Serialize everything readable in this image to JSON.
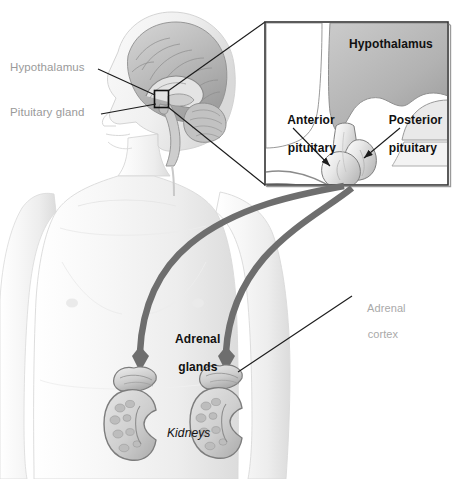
{
  "figure": {
    "background_color": "#ffffff"
  },
  "labels": {
    "hypothalamus_head": "Hypothalamus",
    "pituitary_gland_head": "Pituitary gland",
    "hypothalamus_inset": "Hypothalamus",
    "anterior_pituitary_line1": "Anterior",
    "anterior_pituitary_line2": "pituitary",
    "posterior_pituitary_line1": "Posterior",
    "posterior_pituitary_line2": "pituitary",
    "adrenal_glands_line1": "Adrenal",
    "adrenal_glands_line2": "glands",
    "adrenal_cortex_line1": "Adrenal",
    "adrenal_cortex_line2": "cortex",
    "kidneys": "Kidneys"
  },
  "colors": {
    "label_gray": "#9a9a9a",
    "label_gray_light": "#a9a9a9",
    "label_black": "#111111",
    "leader_line": "#1b1b1b",
    "inset_border": "#333333",
    "arrow_gray": "#6e6e6e",
    "skin_light": "#f4f4f4",
    "skin_shade": "#e2e2e2",
    "brain_gray": "#b8b8b8",
    "hypothalamus_fill": "#b9b9b9",
    "kidney_outline": "#7d7d7d",
    "kidney_fill": "#d8d8d8"
  },
  "structures": {
    "head": "sagittal head and brain section, left facing",
    "brain_marker_box": "small black rectangle over hypothalamus-pituitary region",
    "inset_panel": "magnified view of hypothalamus and pituitary gland",
    "torso": "frontal upper body of male figure",
    "kidneys_count": 2,
    "adrenal_glands_count": 2,
    "pathway_arrows_count": 2
  }
}
